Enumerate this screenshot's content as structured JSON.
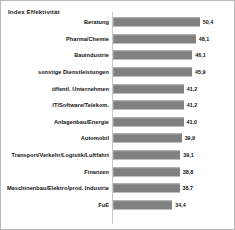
{
  "chart": {
    "title": "Index Effektivität"
  },
  "chart_data": {
    "type": "bar",
    "orientation": "horizontal",
    "title": "Index Effektivität",
    "xlabel": "",
    "ylabel": "",
    "grid": false,
    "legend": null,
    "xlim": [
      0,
      56
    ],
    "decimal_separator": ",",
    "bar_color": "#808080",
    "categories": [
      "Beratung",
      "Pharma/Chemie",
      "Bauindustrie",
      "sonstige Dienstleistungen",
      "öffentl. Unternehmen",
      "IT/Software/Telekom.",
      "Anlagenbau/Energie",
      "Automobil",
      "Transport/Verkehr/Logistik/Luftfahrt",
      "Finanzen",
      "Maschinenbau/Elektro/prod. Industrie",
      "FuE"
    ],
    "values": [
      50.4,
      48.1,
      46.1,
      45.9,
      41.2,
      41.2,
      41.0,
      39.9,
      39.1,
      38.8,
      38.7,
      34.4
    ],
    "value_labels": [
      "50,4",
      "48,1",
      "46,1",
      "45,9",
      "41,2",
      "41,2",
      "41,0",
      "39,9",
      "39,1",
      "38,8",
      "38,7",
      "34,4"
    ],
    "rows": [
      {
        "category": "Beratung",
        "value": 50.4,
        "label": "50,4"
      },
      {
        "category": "Pharma/Chemie",
        "value": 48.1,
        "label": "48,1"
      },
      {
        "category": "Bauindustrie",
        "value": 46.1,
        "label": "46,1"
      },
      {
        "category": "sonstige Dienstleistungen",
        "value": 45.9,
        "label": "45,9"
      },
      {
        "category": "öffentl. Unternehmen",
        "value": 41.2,
        "label": "41,2"
      },
      {
        "category": "IT/Software/Telekom.",
        "value": 41.2,
        "label": "41,2"
      },
      {
        "category": "Anlagenbau/Energie",
        "value": 41.0,
        "label": "41,0"
      },
      {
        "category": "Automobil",
        "value": 39.9,
        "label": "39,9"
      },
      {
        "category": "Transport/Verkehr/Logistik/Luftfahrt",
        "value": 39.1,
        "label": "39,1"
      },
      {
        "category": "Finanzen",
        "value": 38.8,
        "label": "38,8"
      },
      {
        "category": "Maschinenbau/Elektro/prod. Industrie",
        "value": 38.7,
        "label": "38,7"
      },
      {
        "category": "FuE",
        "value": 34.4,
        "label": "34,4"
      }
    ]
  }
}
